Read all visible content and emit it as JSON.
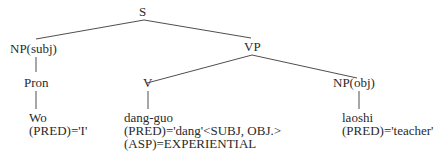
{
  "tree": {
    "root": "S",
    "nodes": {
      "s": "S",
      "np_subj": "NP(subj)",
      "vp": "VP",
      "pron": "Pron",
      "v": "V",
      "np_obj": "NP(obj)"
    },
    "leaves": {
      "wo": {
        "word": "Wo",
        "features": [
          "(PRED)='I'"
        ]
      },
      "dang_guo": {
        "word": "dang-guo",
        "features": [
          "(PRED)='dang'<SUBJ, OBJ.>",
          "(ASP)=EXPERIENTIAL"
        ]
      },
      "laoshi": {
        "word": "laoshi",
        "features": [
          "(PRED)='teacher'"
        ]
      }
    },
    "edges": [
      [
        "S",
        "NP(subj)"
      ],
      [
        "S",
        "VP"
      ],
      [
        "NP(subj)",
        "Pron"
      ],
      [
        "Pron",
        "Wo"
      ],
      [
        "VP",
        "V"
      ],
      [
        "VP",
        "NP(obj)"
      ],
      [
        "V",
        "dang-guo"
      ],
      [
        "NP(obj)",
        "laoshi"
      ]
    ]
  }
}
